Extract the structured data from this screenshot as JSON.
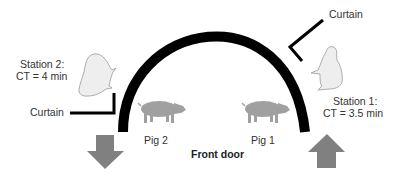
{
  "diagram": {
    "door_label": "Front door",
    "station_2": {
      "title": "Station 2:",
      "cycle_time": "CT = 4 min",
      "curtain_label": "Curtain"
    },
    "station_1": {
      "title": "Station 1:",
      "cycle_time": "CT = 3.5 min",
      "curtain_label": "Curtain"
    },
    "pig_2_label": "Pig 2",
    "pig_1_label": "Pig 1",
    "colors": {
      "arch": "#000000",
      "arrow": "#808080",
      "pig": "#a0a0a0",
      "animal": "#eeeeee",
      "text": "#333333"
    },
    "flows": [
      {
        "name": "exit",
        "direction": "down",
        "position": "left"
      },
      {
        "name": "entry",
        "direction": "up",
        "position": "right"
      }
    ]
  }
}
